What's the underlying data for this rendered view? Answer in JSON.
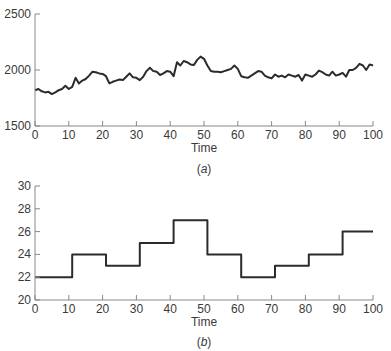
{
  "chart_data": [
    {
      "id": "a",
      "type": "line",
      "panel_label": "(a)",
      "title": "",
      "xlabel": "Time",
      "ylabel": "",
      "xlim": [
        0,
        100
      ],
      "ylim": [
        1500,
        2500
      ],
      "xticks": [
        0,
        10,
        20,
        30,
        40,
        50,
        60,
        70,
        80,
        90,
        100
      ],
      "yticks": [
        1500,
        2000,
        2500
      ],
      "grid": false,
      "series": [
        {
          "name": "series-a",
          "color": "#2b2b2b",
          "x": [
            0,
            1,
            2,
            3,
            4,
            5,
            6,
            7,
            8,
            9,
            10,
            11,
            12,
            13,
            14,
            15,
            16,
            17,
            18,
            19,
            20,
            21,
            22,
            23,
            24,
            25,
            26,
            27,
            28,
            29,
            30,
            31,
            32,
            33,
            34,
            35,
            36,
            37,
            38,
            39,
            40,
            41,
            42,
            43,
            44,
            45,
            46,
            47,
            48,
            49,
            50,
            51,
            52,
            53,
            54,
            55,
            56,
            57,
            58,
            59,
            60,
            61,
            62,
            63,
            64,
            65,
            66,
            67,
            68,
            69,
            70,
            71,
            72,
            73,
            74,
            75,
            76,
            77,
            78,
            79,
            80,
            81,
            82,
            83,
            84,
            85,
            86,
            87,
            88,
            89,
            90,
            91,
            92,
            93,
            94,
            95,
            96,
            97,
            98,
            99,
            100
          ],
          "values": [
            1820,
            1830,
            1810,
            1800,
            1805,
            1785,
            1800,
            1820,
            1830,
            1860,
            1830,
            1850,
            1930,
            1880,
            1905,
            1920,
            1950,
            1985,
            1980,
            1970,
            1965,
            1945,
            1880,
            1895,
            1905,
            1915,
            1910,
            1940,
            1970,
            1935,
            1930,
            1910,
            1940,
            1990,
            2020,
            1990,
            1985,
            1955,
            1970,
            1990,
            1985,
            1945,
            2070,
            2040,
            2080,
            2070,
            2050,
            2045,
            2090,
            2120,
            2100,
            2040,
            1990,
            1985,
            1985,
            1980,
            1990,
            2000,
            2010,
            2040,
            2010,
            1945,
            1935,
            1930,
            1950,
            1970,
            1990,
            1985,
            1950,
            1935,
            1925,
            1960,
            1940,
            1950,
            1935,
            1960,
            1950,
            1940,
            1955,
            1905,
            1960,
            1950,
            1940,
            1960,
            1995,
            1980,
            1960,
            1950,
            1985,
            1950,
            1960,
            1975,
            1940,
            2000,
            2000,
            2020,
            2055,
            2040,
            2000,
            2050,
            2040,
            2040
          ]
        }
      ]
    },
    {
      "id": "b",
      "type": "line",
      "subtype": "step",
      "panel_label": "(b)",
      "title": "",
      "xlabel": "Time",
      "ylabel": "",
      "xlim": [
        0,
        100
      ],
      "ylim": [
        20,
        30
      ],
      "xticks": [
        0,
        10,
        20,
        30,
        40,
        50,
        60,
        70,
        80,
        90,
        100
      ],
      "yticks": [
        20,
        22,
        24,
        26,
        28,
        30
      ],
      "grid": false,
      "series": [
        {
          "name": "series-b",
          "color": "#2b2b2b",
          "steps": [
            {
              "start": 0,
              "end": 11,
              "value": 22
            },
            {
              "start": 11,
              "end": 21,
              "value": 24
            },
            {
              "start": 21,
              "end": 31,
              "value": 23
            },
            {
              "start": 31,
              "end": 41,
              "value": 25
            },
            {
              "start": 41,
              "end": 51,
              "value": 27
            },
            {
              "start": 51,
              "end": 61,
              "value": 24
            },
            {
              "start": 61,
              "end": 71,
              "value": 22
            },
            {
              "start": 71,
              "end": 81,
              "value": 23
            },
            {
              "start": 81,
              "end": 91,
              "value": 24
            },
            {
              "start": 91,
              "end": 100,
              "value": 26
            }
          ]
        }
      ]
    }
  ],
  "labels": {
    "a": {
      "xlabel": "Time",
      "panel": "(a)"
    },
    "b": {
      "xlabel": "Time",
      "panel": "(b)"
    }
  }
}
